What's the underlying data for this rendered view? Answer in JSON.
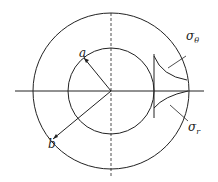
{
  "diagram": {
    "labels": {
      "inner_radius": "a",
      "outer_radius": "b",
      "hoop_stress_symbol": "σ",
      "hoop_stress_sub": "θ",
      "radial_stress_symbol": "σ",
      "radial_stress_sub": "r"
    },
    "geometry": {
      "center": [
        111,
        91
      ],
      "outer_radius_px": 78,
      "inner_radius_px": 43
    },
    "colors": {
      "stroke": "#222222",
      "background": "#ffffff"
    }
  }
}
